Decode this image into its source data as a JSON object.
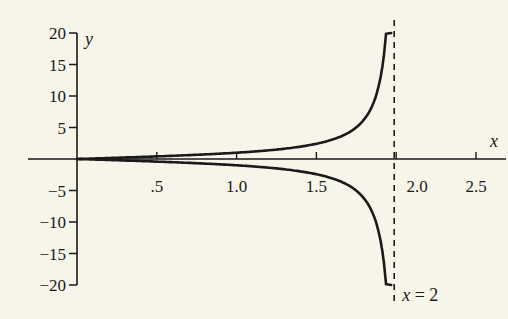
{
  "chart_data": {
    "type": "line",
    "title": "",
    "xlabel": "x",
    "ylabel": "y",
    "xlim": [
      0,
      2.5
    ],
    "ylim": [
      -20,
      20
    ],
    "grid": false,
    "x_ticks": [
      0.5,
      1.0,
      1.5,
      2.0,
      2.5
    ],
    "x_tick_labels": [
      ".5",
      "1.0",
      "1.5",
      "2.0",
      "2.5"
    ],
    "y_ticks": [
      20,
      15,
      10,
      5,
      -5,
      -10,
      -15,
      -20
    ],
    "y_tick_labels": [
      "20",
      "15",
      "10",
      "5",
      "−5",
      "−10",
      "−15",
      "−20"
    ],
    "series": [
      {
        "name": "upper branch",
        "x": [
          0,
          0.25,
          0.5,
          0.75,
          1.0,
          1.25,
          1.5,
          1.6,
          1.7,
          1.8,
          1.85,
          1.9,
          1.93,
          1.95
        ],
        "values": [
          0,
          0.2,
          0.41,
          0.67,
          1.0,
          1.5,
          2.41,
          3.08,
          4.17,
          6.31,
          8.45,
          12.7,
          18.2,
          20
        ]
      },
      {
        "name": "lower branch",
        "x": [
          0,
          0.25,
          0.5,
          0.75,
          1.0,
          1.25,
          1.5,
          1.6,
          1.7,
          1.8,
          1.85,
          1.9,
          1.93,
          1.95
        ],
        "values": [
          0,
          -0.2,
          -0.41,
          -0.67,
          -1.0,
          -1.5,
          -2.41,
          -3.08,
          -4.17,
          -6.31,
          -8.45,
          -12.7,
          -18.2,
          -20
        ]
      }
    ],
    "asymptote": {
      "x": 2,
      "style": "dashed",
      "label": "x = 2"
    },
    "annotations": [
      "x = 2"
    ]
  },
  "colors": {
    "background": "#f7f4ea",
    "ink": "#1a1a1a"
  }
}
